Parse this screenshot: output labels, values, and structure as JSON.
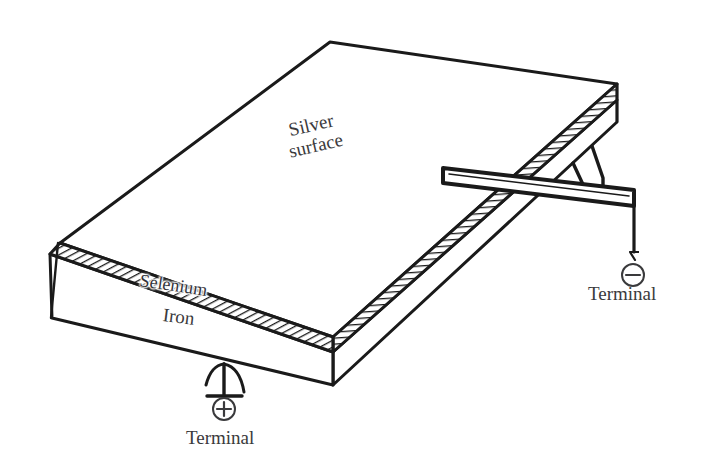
{
  "figure": {
    "kind": "technical-line-drawing",
    "background_color": "#ffffff",
    "ink_color": "#1a1a1a",
    "text_color": "#3a3a3c"
  },
  "labels": {
    "silver_surface": "Silver\nsurface",
    "selenium": "Selenium",
    "iron": "Iron",
    "terminal_positive": "Terminal",
    "terminal_negative": "Terminal"
  },
  "symbols": {
    "positive": "+",
    "negative": "−"
  },
  "layers": [
    {
      "name": "Silver surface",
      "position": "top face"
    },
    {
      "name": "Selenium",
      "position": "hatched middle band"
    },
    {
      "name": "Iron",
      "position": "lower block"
    }
  ],
  "terminals": [
    {
      "polarity": "positive",
      "symbol": "+",
      "label": "Terminal",
      "attached_to": "Iron",
      "side": "front-bottom-left"
    },
    {
      "polarity": "negative",
      "symbol": "−",
      "label": "Terminal",
      "attached_to": "Silver surface",
      "side": "right"
    }
  ],
  "geometry": {
    "top_face": [
      [
        330,
        42
      ],
      [
        617,
        84
      ],
      [
        333,
        337
      ],
      [
        60,
        243
      ]
    ],
    "selenium_band_front": [
      [
        60,
        243
      ],
      [
        333,
        337
      ],
      [
        333,
        352
      ],
      [
        50,
        254
      ]
    ],
    "selenium_band_right": [
      [
        333,
        337
      ],
      [
        617,
        84
      ],
      [
        617,
        100
      ],
      [
        333,
        352
      ]
    ],
    "iron_front": [
      [
        50,
        254
      ],
      [
        333,
        352
      ],
      [
        333,
        385
      ],
      [
        52,
        318
      ]
    ],
    "iron_right": [
      [
        333,
        352
      ],
      [
        617,
        100
      ],
      [
        617,
        122
      ],
      [
        333,
        385
      ]
    ],
    "contact_strip": [
      [
        443,
        168
      ],
      [
        634,
        190
      ],
      [
        634,
        205
      ],
      [
        443,
        182
      ]
    ],
    "neg_wire": [
      [
        634,
        198
      ],
      [
        634,
        258
      ]
    ],
    "neg_circle": {
      "cx": 633,
      "cy": 275,
      "r": 11
    },
    "pos_contact_stem": [
      [
        224,
        367
      ],
      [
        224,
        396
      ]
    ],
    "pos_contact_bar": [
      [
        205,
        396
      ],
      [
        243,
        396
      ]
    ],
    "pos_circle": {
      "cx": 224,
      "cy": 409,
      "r": 11
    }
  },
  "hatching": {
    "style": "diagonal line fill",
    "front_band_angle_deg": 62,
    "right_band_angle_deg": 84,
    "spacing_px": 5
  }
}
